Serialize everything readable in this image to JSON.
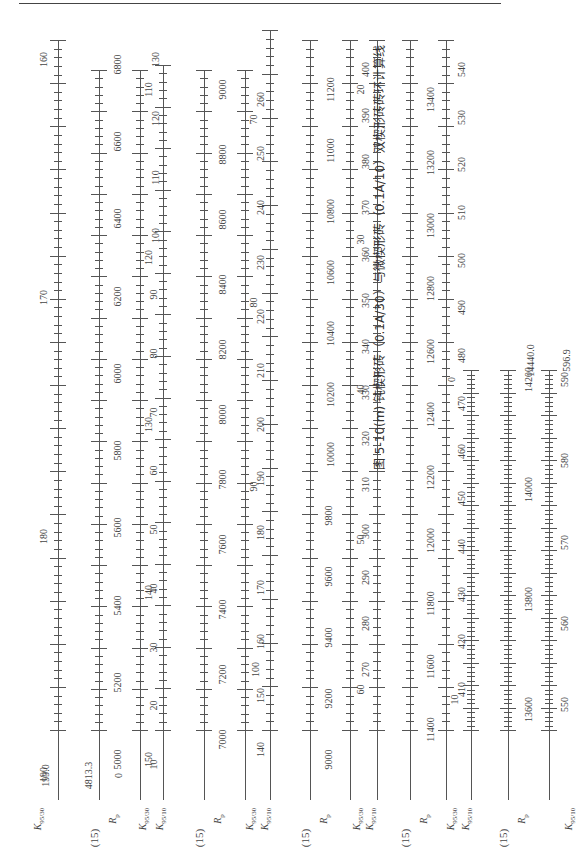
{
  "page": {
    "orientation": "rotated-90-ccw",
    "header_rule": true
  },
  "figure": {
    "caption": "图 5-10(m)   钝楔形砖（0.1A/30）与微楔形砖（0.1A/10）双楔形砖砖环计算线",
    "bands": [
      {
        "group_label": "(15)",
        "scales": [
          {
            "name": "K9530",
            "label": "K",
            "sub": "95/30",
            "start_label": "199.0",
            "ticks": [
              "190",
              "180",
              "170",
              "160"
            ]
          },
          {
            "name": "Rp",
            "label": "R",
            "sub": "p",
            "start_label": "4813.3",
            "ticks": [
              "5000",
              "5200",
              "5400",
              "5600",
              "5800",
              "6000",
              "6200",
              "6400",
              "6600",
              "6800"
            ]
          },
          {
            "name": "K9510",
            "label": "K",
            "sub": "95/10",
            "start_label": "0",
            "ticks": [
              "10",
              "20",
              "30",
              "40",
              "50",
              "60",
              "70",
              "80",
              "90",
              "100",
              "110",
              "120",
              "130"
            ]
          }
        ]
      },
      {
        "group_label": "(15)",
        "scales": [
          {
            "name": "K9530",
            "label": "K",
            "sub": "95/30",
            "ticks": [
              "150",
              "140",
              "130",
              "120",
              "110"
            ]
          },
          {
            "name": "Rp",
            "label": "R",
            "sub": "p",
            "ticks": [
              "7000",
              "7200",
              "7400",
              "7600",
              "7800",
              "8000",
              "8200",
              "8400",
              "8600",
              "8800",
              "9000"
            ]
          },
          {
            "name": "K9510",
            "label": "K",
            "sub": "95/10",
            "ticks": [
              "140",
              "150",
              "160",
              "170",
              "180",
              "190",
              "200",
              "210",
              "220",
              "230",
              "240",
              "250",
              "260"
            ]
          }
        ]
      },
      {
        "group_label": "(15)",
        "scales": [
          {
            "name": "K9530",
            "label": "K",
            "sub": "95/30",
            "ticks": [
              "100",
              "90",
              "80",
              "70"
            ]
          },
          {
            "name": "Rp",
            "label": "R",
            "sub": "p",
            "ticks": [
              "9000",
              "9200",
              "9400",
              "9600",
              "9800",
              "10000",
              "10200",
              "10400",
              "10600",
              "10800",
              "11000",
              "11200"
            ]
          },
          {
            "name": "K9510",
            "label": "K",
            "sub": "95/10",
            "ticks": [
              "270",
              "280",
              "290",
              "300",
              "310",
              "320",
              "330",
              "340",
              "350",
              "360",
              "370",
              "380",
              "390",
              "400"
            ]
          }
        ]
      },
      {
        "group_label": "(15)",
        "scales": [
          {
            "name": "K9530",
            "label": "K",
            "sub": "95/30",
            "ticks": [
              "60",
              "50",
              "40",
              "30",
              "20"
            ]
          },
          {
            "name": "Rp",
            "label": "R",
            "sub": "p",
            "ticks": [
              "11400",
              "11600",
              "11800",
              "12000",
              "12200",
              "12400",
              "12600",
              "12800",
              "13000",
              "13200",
              "13400"
            ]
          },
          {
            "name": "K9510",
            "label": "K",
            "sub": "95/10",
            "ticks": [
              "410",
              "420",
              "430",
              "440",
              "450",
              "460",
              "470",
              "480",
              "490",
              "500",
              "510",
              "520",
              "530",
              "540"
            ]
          }
        ]
      },
      {
        "group_label": "(15)",
        "scales": [
          {
            "name": "K9530",
            "label": "K",
            "sub": "95/30",
            "ticks": [
              "10",
              "0"
            ]
          },
          {
            "name": "Rp",
            "label": "R",
            "sub": "p",
            "end_label": "14440.0",
            "ticks": [
              "13600",
              "13800",
              "14000",
              "14200"
            ]
          },
          {
            "name": "K9510",
            "label": "K",
            "sub": "95/10",
            "end_label": "596.9",
            "ticks": [
              "550",
              "560",
              "570",
              "580",
              "590"
            ]
          }
        ]
      }
    ]
  }
}
